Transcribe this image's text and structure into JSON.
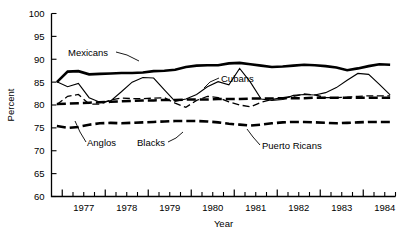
{
  "chart_data": {
    "type": "line",
    "title": "",
    "xlabel": "Year",
    "ylabel": "Percent",
    "ylim": [
      60,
      100
    ],
    "yticks": [
      60,
      65,
      70,
      75,
      80,
      85,
      90,
      95,
      100
    ],
    "ytick_labels": [
      "60",
      "65",
      "70",
      "75",
      "80",
      "85",
      "90",
      "95",
      "100"
    ],
    "xlim": [
      1976.75,
      1984.75
    ],
    "xticks": [
      1977,
      1978,
      1979,
      1980,
      1981,
      1982,
      1983,
      1984
    ],
    "xtick_labels": [
      "1977",
      "1978",
      "1979",
      "1980",
      "1981",
      "1982",
      "1983",
      "1984"
    ],
    "x_minor_interval_per_year": 4,
    "grid": false,
    "legend_position": "inline-annotations",
    "x": [
      1976.875,
      1977.125,
      1977.375,
      1977.625,
      1977.875,
      1978.125,
      1978.375,
      1978.625,
      1978.875,
      1979.125,
      1979.375,
      1979.625,
      1979.875,
      1980.125,
      1980.375,
      1980.625,
      1980.875,
      1981.125,
      1981.375,
      1981.625,
      1981.875,
      1982.125,
      1982.375,
      1982.625,
      1982.875,
      1983.125,
      1983.375,
      1983.625,
      1983.875,
      1984.125,
      1984.375,
      1984.625
    ],
    "series": [
      {
        "name": "Mexicans",
        "style": "thick-solid",
        "label_x": 1977.1,
        "label_y": 91.8,
        "values": [
          85.0,
          87.3,
          87.4,
          86.7,
          86.8,
          86.9,
          87.0,
          87.0,
          87.1,
          87.4,
          87.5,
          87.7,
          88.3,
          88.6,
          88.7,
          88.7,
          89.1,
          89.2,
          88.9,
          88.6,
          88.3,
          88.4,
          88.6,
          88.8,
          88.7,
          88.5,
          88.2,
          87.6,
          88.0,
          88.5,
          88.9,
          88.8
        ]
      },
      {
        "name": "Cubans",
        "style": "thin-solid",
        "label_x": 1980.4,
        "label_y": 84.3,
        "values": [
          85.1,
          84.0,
          84.7,
          81.6,
          80.6,
          80.9,
          82.9,
          85.0,
          86.0,
          85.9,
          83.3,
          80.8,
          81.3,
          82.3,
          84.0,
          85.1,
          84.4,
          88.0,
          85.0,
          81.3,
          81.0,
          81.2,
          82.1,
          82.3,
          82.2,
          82.7,
          83.8,
          85.4,
          86.9,
          86.7,
          84.5,
          82.2
        ]
      },
      {
        "name": "Puerto Ricans",
        "style": "medium-dashed",
        "label_x": 1981.85,
        "label_y": 71.8,
        "values": [
          80.1,
          81.9,
          82.3,
          80.2,
          80.2,
          81.1,
          81.5,
          81.4,
          81.4,
          81.5,
          81.6,
          80.4,
          79.5,
          81.0,
          81.9,
          81.6,
          80.7,
          80.0,
          79.6,
          80.6,
          81.2,
          81.6,
          81.9,
          82.4,
          82.2,
          81.6,
          81.6,
          81.7,
          81.9,
          82.0,
          82.0,
          82.0
        ]
      },
      {
        "name": "Anglos",
        "style": "thick-dashed-flat",
        "label_x": 1977.5,
        "label_y": 72.3,
        "values": [
          80.2,
          80.3,
          80.4,
          80.5,
          80.6,
          80.7,
          80.8,
          80.9,
          81.0,
          81.0,
          81.1,
          81.1,
          81.2,
          81.2,
          81.2,
          81.3,
          81.3,
          81.3,
          81.4,
          81.4,
          81.4,
          81.5,
          81.5,
          81.5,
          81.6,
          81.6,
          81.6,
          81.6,
          81.6,
          81.6,
          81.6,
          81.6
        ]
      },
      {
        "name": "Blacks",
        "style": "thick-dashed",
        "label_x": 1978.65,
        "label_y": 72.3,
        "values": [
          75.4,
          75.0,
          75.2,
          75.7,
          76.0,
          76.1,
          76.0,
          76.1,
          76.2,
          76.3,
          76.4,
          76.5,
          76.5,
          76.5,
          76.4,
          76.2,
          75.9,
          75.7,
          75.5,
          75.7,
          76.0,
          76.2,
          76.3,
          76.3,
          76.2,
          76.1,
          76.0,
          76.1,
          76.2,
          76.3,
          76.3,
          76.3
        ]
      }
    ],
    "annotations": [
      {
        "text": "Mexicans",
        "x": 68,
        "y": 56
      },
      {
        "text": "Cubans",
        "x": 221,
        "y": 82
      },
      {
        "text": "Anglos",
        "x": 87,
        "y": 146
      },
      {
        "text": "Blacks",
        "x": 137,
        "y": 146
      },
      {
        "text": "Puerto Ricans",
        "x": 262,
        "y": 149
      }
    ]
  },
  "colors": {
    "ink": "#000000",
    "paper": "#ffffff"
  }
}
